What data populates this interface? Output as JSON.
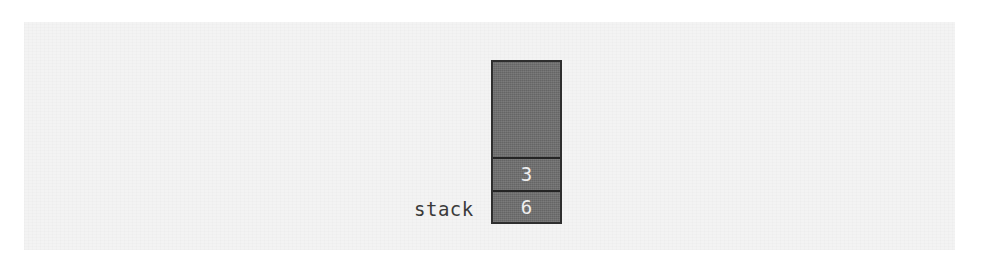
{
  "figure": {
    "label": "stack",
    "colors": {
      "page_background": "#ffffff",
      "paper_background": "#f3f3f3",
      "box_fill": "#6e6e6e",
      "box_border": "#2e2e2e",
      "divider": "#242424",
      "value_text": "#efefef",
      "label_text": "#3a3a3a"
    },
    "stack": {
      "empty_slot_label": "",
      "cells": [
        {
          "value": "3"
        },
        {
          "value": "6"
        }
      ]
    }
  }
}
